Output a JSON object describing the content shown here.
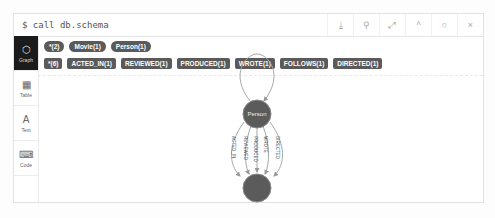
{
  "header": {
    "command": "$ call db.schema",
    "buttons": [
      "download-icon",
      "pin-icon",
      "expand-icon",
      "collapse-icon",
      "refresh-icon",
      "close-icon"
    ],
    "glyphs": [
      "⤓",
      "⚲",
      "⤢",
      "^",
      "○",
      "×"
    ]
  },
  "sidebar": {
    "items": [
      {
        "label": "Graph",
        "icon": "⬡",
        "active": true
      },
      {
        "label": "Table",
        "icon": "▦"
      },
      {
        "label": "Text",
        "icon": "A"
      },
      {
        "label": "Code",
        "icon": "⌨"
      }
    ]
  },
  "node_labels": [
    "*(2)",
    "Movie(1)",
    "Person(1)"
  ],
  "relationship_types": [
    "*(6)",
    "ACTED_IN(1)",
    "REVIEWED(1)",
    "PRODUCED(1)",
    "WROTE(1)",
    "FOLLOWS(1)",
    "DIRECTED(1)"
  ],
  "graph": {
    "nodes": [
      {
        "label": "Person",
        "color": "#5b5b5b"
      },
      {
        "label": "",
        "color": "#5b5b5b"
      }
    ],
    "edges": [
      "ACTED_IN",
      "REVIEWED",
      "PRODUCED",
      "WROTE",
      "DIRECTED"
    ],
    "self_loop": "FOLLOWS"
  }
}
